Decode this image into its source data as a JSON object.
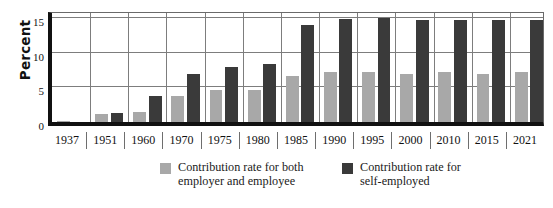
{
  "chart_data": {
    "type": "bar",
    "title": "",
    "xlabel": "",
    "ylabel": "Percent",
    "ylim": [
      0,
      16.5
    ],
    "yticks": [
      0,
      5,
      10,
      15
    ],
    "grid": "horizontal gridlines at 5, 10, 15 plus vertical separators between year groups",
    "legend_position": "below plot, centered-right",
    "categories": [
      "1937",
      "1951",
      "1960",
      "1970",
      "1975",
      "1980",
      "1985",
      "1990",
      "1995",
      "2000",
      "2010",
      "2015",
      "2021"
    ],
    "series": [
      {
        "name": "Contribution rate for both\nemployer and employee",
        "color": "#a8a8a8",
        "values": [
          0.2,
          1.1,
          1.5,
          3.7,
          4.7,
          4.7,
          6.6,
          7.3,
          7.3,
          7.0,
          7.3,
          7.0,
          7.3
        ]
      },
      {
        "name": "Contribution rate for\nself-employed",
        "color": "#3a3a3a",
        "values": [
          0.0,
          1.3,
          3.8,
          6.9,
          8.0,
          8.4,
          14.0,
          14.9,
          15.1,
          14.7,
          14.7,
          14.7,
          14.7
        ]
      }
    ]
  },
  "axis": {
    "y_title": "Percent",
    "tick_labels": [
      "15",
      "10",
      "5",
      "0"
    ]
  },
  "legend": {
    "items": [
      {
        "label": "Contribution rate for both\nemployer and employee",
        "color": "#a8a8a8"
      },
      {
        "label": "Contribution rate for\nself-employed",
        "color": "#3a3a3a"
      }
    ]
  },
  "colors": {
    "series_employer_employee": "#a8a8a8",
    "series_self_employed": "#3a3a3a",
    "axis": "#111111",
    "gridline": "#7d7d7d",
    "background": "#ffffff"
  }
}
